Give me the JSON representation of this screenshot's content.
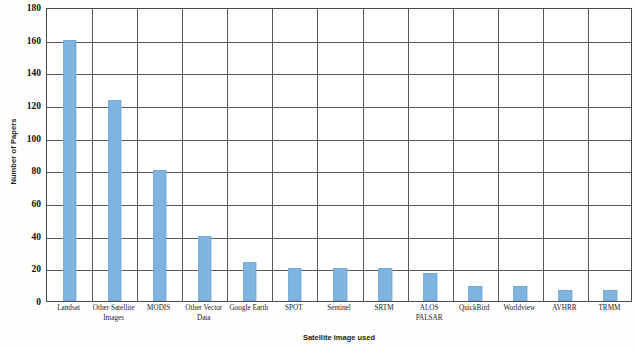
{
  "chart_data": {
    "type": "bar",
    "title": "",
    "xlabel": "Satellite image used",
    "ylabel": "Number of Papers",
    "categories": [
      "Landsat",
      "Other Satellite Images",
      "MODIS",
      "Other Vector Data",
      "Google Earth",
      "SPOT",
      "Sentinel",
      "SRTM",
      "ALOS PALSAR",
      "QuickBird",
      "Worldview",
      "AVHRR",
      "TRMM"
    ],
    "values": [
      160,
      123,
      80,
      40,
      24,
      20,
      20,
      20,
      17,
      9,
      9,
      7,
      7
    ],
    "ylim": [
      0,
      180
    ],
    "ytick_step": 20,
    "yticks": [
      0,
      20,
      40,
      60,
      80,
      100,
      120,
      140,
      160,
      180
    ],
    "ytick_labels": [
      "0",
      "20",
      "40",
      "60",
      "80",
      "100",
      "120",
      "140",
      "160",
      "180"
    ],
    "grid": "horizontal-and-vertical-category-separators",
    "legend": "none",
    "bar_color": "#7fb3e0",
    "grid_color": "#595959",
    "axis_color": "#4a4a4a",
    "background_color": "#ffffff"
  }
}
